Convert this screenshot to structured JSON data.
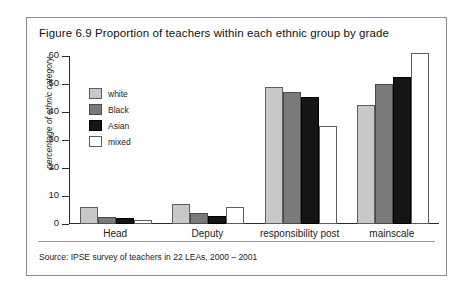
{
  "figure": {
    "title": "Figure 6.9 Proportion of teachers within each ethnic group by grade",
    "source": "Source: IPSE survey of teachers in 22 LEAs, 2000 – 2001"
  },
  "legend": {
    "position": "top-left-inside-plot",
    "items": [
      {
        "label": "white",
        "color": "#c8c8c8"
      },
      {
        "label": "Black",
        "color": "#7a7a7a"
      },
      {
        "label": "Asian",
        "color": "#151515"
      },
      {
        "label": "mixed",
        "color": "#ffffff"
      }
    ]
  },
  "axes": {
    "y_title": "percentage of ethnic category",
    "y_ticks": [
      "0",
      "10",
      "20",
      "30",
      "40",
      "50",
      "60"
    ],
    "x_categories": [
      "Head",
      "Deputy",
      "responsibility post",
      "mainscale"
    ]
  },
  "chart_data": {
    "type": "bar",
    "title": "Figure 6.9 Proportion of teachers within each ethnic group by grade",
    "xlabel": "",
    "ylabel": "percentage of ethnic category",
    "ylim": [
      0,
      60
    ],
    "ytick_step": 10,
    "grid": false,
    "legend_position": "upper left",
    "categories": [
      "Head",
      "Deputy",
      "responsibility post",
      "mainscale"
    ],
    "series": [
      {
        "name": "white",
        "color": "#c8c8c8",
        "values": [
          6,
          7,
          49,
          42.5
        ]
      },
      {
        "name": "Black",
        "color": "#7a7a7a",
        "values": [
          2.5,
          4,
          47,
          50
        ]
      },
      {
        "name": "Asian",
        "color": "#151515",
        "values": [
          2,
          3,
          45.5,
          52.5
        ]
      },
      {
        "name": "mixed",
        "color": "#ffffff",
        "values": [
          1.5,
          6,
          35,
          61
        ]
      }
    ],
    "source": "Source: IPSE survey of teachers in 22 LEAs, 2000 – 2001"
  }
}
